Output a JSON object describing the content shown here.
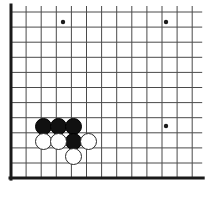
{
  "board": {
    "title": "Go board corner diagram",
    "board_size": 19,
    "visible_region": "bottom-left corner",
    "background_color": "#ffffff",
    "line_color": "#4a4a4a",
    "edge_color": "#1a1a1a",
    "black_color": "#111111",
    "white_color": "#ffffff",
    "white_outline_color": "#2a2a2a",
    "grid": {
      "spacing_px": 15.1,
      "origin_x_px": 11,
      "origin_y_px": 12,
      "vertical_line_count": 13,
      "horizontal_line_count": 12,
      "thin_line_width_px": 1,
      "edge_line_width_px": 3
    },
    "edges": {
      "left_edge_visible": true,
      "bottom_edge_visible": true,
      "top_edge_visible": false,
      "right_edge_visible": false
    },
    "star_points": [
      {
        "name": "hoshi-top-left",
        "x_px": 63,
        "y_px": 22,
        "radius_px": 2.2
      },
      {
        "name": "hoshi-top-right",
        "x_px": 166,
        "y_px": 22,
        "radius_px": 2.2
      },
      {
        "name": "hoshi-right",
        "x_px": 166,
        "y_px": 126,
        "radius_px": 2.2
      }
    ],
    "stones": [
      {
        "name": "black-stone-1",
        "color": "black",
        "x_px": 43,
        "y_px": 126,
        "radius_px": 8.5
      },
      {
        "name": "black-stone-2",
        "color": "black",
        "x_px": 58,
        "y_px": 126,
        "radius_px": 8.5
      },
      {
        "name": "black-stone-3",
        "color": "black",
        "x_px": 73,
        "y_px": 126,
        "radius_px": 8.5
      },
      {
        "name": "black-stone-4",
        "color": "black",
        "x_px": 73,
        "y_px": 141,
        "radius_px": 8.5
      },
      {
        "name": "white-stone-1",
        "color": "white",
        "x_px": 43,
        "y_px": 141,
        "radius_px": 8.5
      },
      {
        "name": "white-stone-2",
        "color": "white",
        "x_px": 58,
        "y_px": 141,
        "radius_px": 8.5
      },
      {
        "name": "white-stone-3",
        "color": "white",
        "x_px": 88,
        "y_px": 141,
        "radius_px": 8.5
      },
      {
        "name": "white-stone-4",
        "color": "white",
        "x_px": 73,
        "y_px": 156,
        "radius_px": 8.5
      }
    ],
    "stone_counts": {
      "black": 4,
      "white": 4,
      "total": 8
    }
  }
}
